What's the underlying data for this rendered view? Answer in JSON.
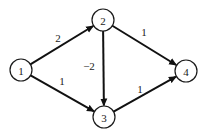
{
  "graph": {
    "type": "directed-weighted",
    "nodes": [
      {
        "id": "1",
        "label": "1",
        "x": 21,
        "y": 70
      },
      {
        "id": "2",
        "label": "2",
        "x": 103,
        "y": 20
      },
      {
        "id": "3",
        "label": "3",
        "x": 104,
        "y": 117
      },
      {
        "id": "4",
        "label": "4",
        "x": 186,
        "y": 71
      }
    ],
    "node_radius": 11,
    "edges": [
      {
        "from": "1",
        "to": "2",
        "weight": "2",
        "label_x": 58,
        "label_y": 38
      },
      {
        "from": "1",
        "to": "3",
        "weight": "1",
        "label_x": 62,
        "label_y": 81
      },
      {
        "from": "2",
        "to": "3",
        "weight": "−2",
        "label_x": 89,
        "label_y": 66
      },
      {
        "from": "2",
        "to": "4",
        "weight": "1",
        "label_x": 144,
        "label_y": 32
      },
      {
        "from": "3",
        "to": "4",
        "weight": "1",
        "label_x": 140,
        "label_y": 89
      }
    ],
    "colors": {
      "stroke": "#111111",
      "background": "#ffffff"
    }
  }
}
